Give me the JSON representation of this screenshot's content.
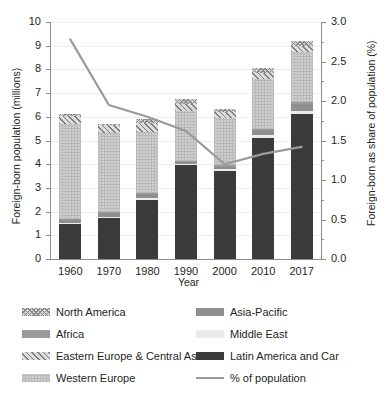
{
  "chart_data": {
    "type": "bar",
    "title": "",
    "xlabel": "Year",
    "ylabel": "Foreign-born population (millions)",
    "ylabel_right": "Foreign-born as share of population (%)",
    "categories": [
      "1960",
      "1970",
      "1980",
      "1990",
      "2000",
      "2010",
      "2017"
    ],
    "ylim": [
      0,
      10
    ],
    "yticks": [
      0,
      1,
      2,
      3,
      4,
      5,
      6,
      7,
      8,
      9,
      10
    ],
    "ylim_right": [
      0.0,
      3.0
    ],
    "yticks_right": [
      "0.0",
      "0.5",
      "1.0",
      "1.5",
      "2.0",
      "2.5",
      "3.0"
    ],
    "grid": true,
    "legend_position": "below",
    "stacked": true,
    "series": [
      {
        "name": "Latin America and Car",
        "color": "#3b3b3b",
        "pattern": "solid-dark",
        "values": [
          1.5,
          1.75,
          2.5,
          3.95,
          3.7,
          5.1,
          6.1
        ]
      },
      {
        "name": "Middle East",
        "color": "#ececec",
        "pattern": "solid-light",
        "values": [
          0.04,
          0.04,
          0.06,
          0.08,
          0.1,
          0.12,
          0.14
        ]
      },
      {
        "name": "Asia-Pacific",
        "color": "#8f8f8f",
        "pattern": "solid-mid",
        "values": [
          0.13,
          0.18,
          0.2,
          0.08,
          0.1,
          0.22,
          0.3
        ]
      },
      {
        "name": "Africa",
        "color": "#9a9a9a",
        "pattern": "solid-mid",
        "values": [
          0.03,
          0.03,
          0.04,
          0.04,
          0.05,
          0.06,
          0.08
        ]
      },
      {
        "name": "Western Europe",
        "color": "#cfcfcf",
        "pattern": "fine-check",
        "values": [
          4.0,
          3.3,
          2.55,
          2.1,
          2.0,
          2.1,
          2.1
        ]
      },
      {
        "name": "Eastern Europe & Central Asia",
        "color": "#dcdcdc",
        "pattern": "diagonal-hatch",
        "values": [
          0.35,
          0.35,
          0.4,
          0.3,
          0.25,
          0.25,
          0.25
        ]
      },
      {
        "name": "North America",
        "color": "#d4d4d4",
        "pattern": "cross-hatch",
        "values": [
          0.05,
          0.05,
          0.15,
          0.2,
          0.15,
          0.2,
          0.23
        ]
      }
    ],
    "line_series": {
      "name": "% of population",
      "color": "#9a9a9a",
      "axis": "right",
      "unit": "%",
      "values": [
        2.78,
        1.95,
        1.8,
        1.62,
        1.2,
        1.33,
        1.42
      ]
    }
  },
  "axes": {
    "left_title": "Foreign-born population (millions)",
    "right_title": "Foreign-born as share of population (%)",
    "x_title": "Year"
  },
  "legend": {
    "items": [
      {
        "label": "North America",
        "swatch": "north-america-swatch"
      },
      {
        "label": "Asia-Pacific",
        "swatch": "asia-pacific-swatch"
      },
      {
        "label": "Africa",
        "swatch": "africa-swatch"
      },
      {
        "label": "Middle East",
        "swatch": "middle-east-swatch"
      },
      {
        "label": "Eastern Europe & Central Asia",
        "swatch": "eastern-europe-swatch"
      },
      {
        "label": "Latin America and Car",
        "swatch": "latin-america-swatch"
      },
      {
        "label": "Western Europe",
        "swatch": "western-europe-swatch"
      },
      {
        "label": "% of population",
        "swatch": "percent-line-swatch"
      }
    ]
  }
}
